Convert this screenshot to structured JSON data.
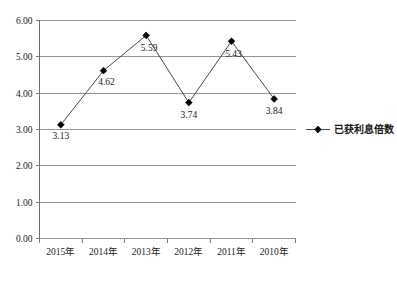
{
  "chart_data": {
    "type": "line",
    "title": "",
    "xlabel": "",
    "ylabel": "",
    "categories": [
      "2015年",
      "2014年",
      "2013年",
      "2012年",
      "2011年",
      "2010年"
    ],
    "series": [
      {
        "name": "已获利息倍数",
        "values": [
          3.13,
          4.62,
          5.59,
          3.74,
          5.43,
          3.84
        ],
        "marker": "diamond",
        "color": "#000000"
      }
    ],
    "value_labels": [
      "3.13",
      "4.62",
      "5.59",
      "3.74",
      "5.43",
      "3.84"
    ],
    "ylim": [
      0.0,
      6.0
    ],
    "ytick_step": 1.0,
    "ytick_labels": [
      "0.00",
      "1.00",
      "2.00",
      "3.00",
      "4.00",
      "5.00",
      "6.00"
    ],
    "grid": true,
    "legend_position": "right",
    "legend_entries": [
      "已获利息倍数"
    ]
  },
  "legend": {
    "entry_label": "已获利息倍数"
  }
}
